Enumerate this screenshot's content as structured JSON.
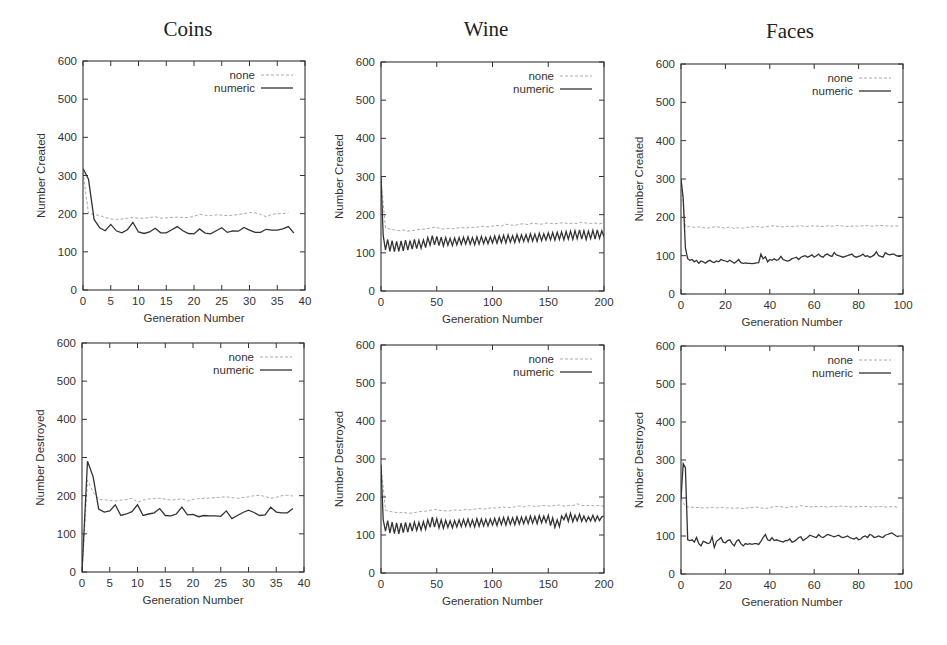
{
  "figure": {
    "columns": [
      "Coins",
      "Wine",
      "Faces"
    ],
    "legend": {
      "none": "none",
      "numeric": "numeric"
    },
    "colors": {
      "none": "#aaaaaa",
      "numeric": "#333333",
      "axis": "#333333"
    }
  },
  "chart_data": [
    {
      "id": "coins-created",
      "type": "line",
      "title": "Coins",
      "xlabel": "Generation Number",
      "ylabel": "Number Created",
      "xlim": [
        0,
        40
      ],
      "ylim": [
        0,
        600
      ],
      "xticks": [
        0,
        5,
        10,
        15,
        20,
        25,
        30,
        35,
        40
      ],
      "yticks": [
        0,
        100,
        200,
        300,
        400,
        500,
        600
      ],
      "legend_position": "top-right",
      "series": [
        {
          "name": "none",
          "style": "dashed",
          "x_start": 0,
          "x_step": 1,
          "values": [
            310,
            200,
            198,
            195,
            190,
            186,
            185,
            186,
            188,
            190,
            188,
            188,
            190,
            192,
            188,
            189,
            190,
            191,
            190,
            190,
            193,
            198,
            196,
            195,
            197,
            196,
            195,
            196,
            198,
            200,
            203,
            202,
            198,
            192,
            198,
            200,
            200,
            203
          ]
        },
        {
          "name": "numeric",
          "style": "solid",
          "x_start": 0,
          "x_step": 1,
          "values": [
            318,
            290,
            185,
            163,
            155,
            172,
            155,
            150,
            158,
            177,
            152,
            148,
            152,
            162,
            150,
            150,
            158,
            166,
            155,
            148,
            147,
            160,
            149,
            147,
            155,
            163,
            151,
            155,
            154,
            164,
            157,
            151,
            151,
            159,
            157,
            157,
            160,
            166,
            149
          ]
        }
      ]
    },
    {
      "id": "wine-created",
      "type": "line",
      "title": "Wine",
      "xlabel": "Generation Number",
      "ylabel": "Number Created",
      "xlim": [
        0,
        200
      ],
      "ylim": [
        0,
        600
      ],
      "xticks": [
        0,
        50,
        100,
        150,
        200
      ],
      "yticks": [
        0,
        100,
        200,
        300,
        400,
        500,
        600
      ],
      "legend_position": "top-right",
      "series": [
        {
          "name": "none",
          "style": "dashed",
          "x_start": 0,
          "x_step": 4,
          "values": [
            290,
            165,
            162,
            160,
            158,
            160,
            157,
            158,
            160,
            162,
            163,
            165,
            167,
            165,
            162,
            164,
            163,
            165,
            166,
            165,
            167,
            166,
            168,
            170,
            168,
            170,
            172,
            170,
            175,
            173,
            172,
            175,
            176,
            174,
            178,
            176,
            175,
            178,
            177,
            176,
            178,
            179,
            176,
            178,
            177,
            180,
            178,
            177,
            178,
            176,
            178
          ]
        },
        {
          "name": "numeric",
          "style": "solid",
          "x_start": 0,
          "x_step": 2,
          "values": [
            300,
            145,
            108,
            135,
            104,
            132,
            103,
            130,
            104,
            131,
            105,
            133,
            107,
            132,
            110,
            135,
            111,
            133,
            112,
            134,
            114,
            140,
            120,
            145,
            121,
            143,
            119,
            141,
            118,
            140,
            120,
            138,
            119,
            139,
            121,
            140,
            122,
            141,
            123,
            142,
            122,
            140,
            121,
            142,
            123,
            143,
            124,
            141,
            124,
            142,
            126,
            144,
            125,
            145,
            127,
            146,
            126,
            147,
            128,
            145,
            127,
            148,
            129,
            147,
            130,
            148,
            130,
            150,
            131,
            149,
            130,
            151,
            132,
            150,
            133,
            152,
            134,
            153,
            133,
            154,
            135,
            155,
            134,
            156,
            136,
            157,
            135,
            158,
            137,
            160,
            136,
            158,
            135,
            157,
            137,
            159,
            136,
            160,
            138,
            158,
            142
          ]
        }
      ]
    },
    {
      "id": "faces-created",
      "type": "line",
      "title": "Faces",
      "xlabel": "Generation Number",
      "ylabel": "Number Created",
      "xlim": [
        0,
        100
      ],
      "ylim": [
        0,
        600
      ],
      "xticks": [
        0,
        20,
        40,
        60,
        80,
        100
      ],
      "yticks": [
        0,
        100,
        200,
        300,
        400,
        500,
        600
      ],
      "legend_position": "top-right",
      "series": [
        {
          "name": "none",
          "style": "dashed",
          "x_start": 0,
          "x_step": 2,
          "values": [
            300,
            175,
            176,
            174,
            175,
            173,
            172,
            174,
            176,
            173,
            172,
            175,
            171,
            173,
            172,
            174,
            175,
            176,
            174,
            175,
            177,
            178,
            176,
            175,
            177,
            176,
            177,
            178,
            176,
            177,
            178,
            177,
            176,
            178,
            177,
            179,
            178,
            177,
            176,
            178,
            177,
            178,
            179,
            177,
            178,
            179,
            178,
            177,
            178,
            177
          ]
        },
        {
          "name": "numeric",
          "style": "solid",
          "x_start": 0,
          "x_step": 1,
          "values": [
            300,
            250,
            120,
            92,
            88,
            90,
            84,
            88,
            80,
            86,
            84,
            80,
            85,
            88,
            84,
            82,
            86,
            84,
            90,
            88,
            86,
            84,
            88,
            84,
            80,
            85,
            90,
            82,
            80,
            81,
            80,
            80,
            79,
            80,
            81,
            82,
            104,
            92,
            97,
            84,
            90,
            88,
            92,
            88,
            90,
            98,
            90,
            88,
            86,
            88,
            92,
            94,
            96,
            90,
            96,
            98,
            100,
            96,
            99,
            102,
            96,
            100,
            104,
            98,
            96,
            102,
            104,
            100,
            98,
            108,
            102,
            100,
            98,
            96,
            98,
            100,
            102,
            104,
            98,
            96,
            98,
            100,
            104,
            98,
            100,
            96,
            98,
            102,
            110,
            100,
            98,
            96,
            108,
            104,
            102,
            104,
            104,
            100,
            98,
            98
          ]
        }
      ]
    },
    {
      "id": "coins-destroyed",
      "type": "line",
      "title": "",
      "xlabel": "Generation Number",
      "ylabel": "Number Destroyed",
      "xlim": [
        0,
        40
      ],
      "ylim": [
        0,
        600
      ],
      "xticks": [
        0,
        5,
        10,
        15,
        20,
        25,
        30,
        35,
        40
      ],
      "yticks": [
        0,
        100,
        200,
        300,
        400,
        500,
        600
      ],
      "legend_position": "top-right",
      "series": [
        {
          "name": "none",
          "style": "dashed",
          "x_start": 0,
          "x_step": 1,
          "values": [
            0,
            240,
            210,
            190,
            189,
            188,
            186,
            188,
            190,
            193,
            183,
            188,
            191,
            192,
            193,
            191,
            188,
            190,
            192,
            186,
            190,
            192,
            193,
            194,
            195,
            196,
            197,
            195,
            193,
            195,
            197,
            200,
            201,
            198,
            193,
            196,
            200,
            201,
            199
          ]
        },
        {
          "name": "numeric",
          "style": "solid",
          "x_start": 0,
          "x_step": 1,
          "values": [
            0,
            290,
            250,
            165,
            157,
            160,
            176,
            148,
            152,
            158,
            176,
            148,
            152,
            155,
            166,
            148,
            147,
            152,
            170,
            150,
            151,
            145,
            148,
            147,
            147,
            146,
            160,
            140,
            148,
            156,
            162,
            156,
            148,
            150,
            170,
            157,
            155,
            155,
            166
          ]
        }
      ]
    },
    {
      "id": "wine-destroyed",
      "type": "line",
      "title": "",
      "xlabel": "Generation Number",
      "ylabel": "Number Destroyed",
      "xlim": [
        0,
        200
      ],
      "ylim": [
        0,
        600
      ],
      "xticks": [
        0,
        50,
        100,
        150,
        200
      ],
      "yticks": [
        0,
        100,
        200,
        300,
        400,
        500,
        600
      ],
      "legend_position": "top-right",
      "series": [
        {
          "name": "none",
          "style": "dashed",
          "x_start": 0,
          "x_step": 4,
          "values": [
            285,
            165,
            162,
            160,
            158,
            160,
            157,
            158,
            160,
            162,
            163,
            165,
            167,
            165,
            164,
            163,
            165,
            166,
            165,
            167,
            166,
            168,
            170,
            168,
            170,
            172,
            170,
            174,
            173,
            172,
            174,
            176,
            174,
            177,
            176,
            175,
            178,
            177,
            176,
            178,
            179,
            176,
            178,
            177,
            182,
            178,
            177,
            178,
            176,
            178,
            175
          ]
        },
        {
          "name": "numeric",
          "style": "solid",
          "x_start": 0,
          "x_step": 2,
          "values": [
            285,
            140,
            110,
            138,
            105,
            134,
            104,
            132,
            103,
            131,
            106,
            133,
            108,
            132,
            110,
            134,
            112,
            133,
            113,
            135,
            115,
            140,
            120,
            147,
            121,
            143,
            119,
            140,
            118,
            139,
            120,
            137,
            119,
            138,
            121,
            140,
            122,
            141,
            123,
            142,
            122,
            140,
            121,
            143,
            123,
            142,
            124,
            141,
            124,
            142,
            126,
            144,
            125,
            145,
            127,
            146,
            126,
            147,
            128,
            145,
            127,
            148,
            129,
            147,
            130,
            148,
            130,
            150,
            131,
            149,
            130,
            151,
            132,
            150,
            133,
            152,
            125,
            145,
            120,
            140,
            122,
            150,
            140,
            155,
            136,
            157,
            135,
            152,
            137,
            155,
            136,
            150,
            135,
            148,
            137,
            152,
            136,
            150,
            138,
            148,
            150
          ]
        }
      ]
    },
    {
      "id": "faces-destroyed",
      "type": "line",
      "title": "",
      "xlabel": "Generation Number",
      "ylabel": "Number Destroyed",
      "xlim": [
        0,
        100
      ],
      "ylim": [
        0,
        600
      ],
      "xticks": [
        0,
        20,
        40,
        60,
        80,
        100
      ],
      "yticks": [
        0,
        100,
        200,
        300,
        400,
        500,
        600
      ],
      "legend_position": "top-right",
      "series": [
        {
          "name": "none",
          "style": "dashed",
          "x_start": 0,
          "x_step": 2,
          "values": [
            200,
            178,
            176,
            175,
            175,
            174,
            174,
            175,
            174,
            175,
            174,
            174,
            173,
            174,
            172,
            174,
            175,
            176,
            174,
            172,
            175,
            177,
            178,
            176,
            175,
            177,
            176,
            180,
            178,
            176,
            178,
            177,
            178,
            176,
            178,
            177,
            179,
            178,
            177,
            176,
            178,
            177,
            178,
            176,
            177,
            178,
            176,
            177,
            178,
            174
          ]
        },
        {
          "name": "numeric",
          "style": "solid",
          "x_start": 0,
          "x_step": 1,
          "values": [
            200,
            290,
            280,
            90,
            88,
            90,
            84,
            96,
            80,
            74,
            86,
            84,
            80,
            82,
            98,
            70,
            86,
            90,
            96,
            84,
            82,
            88,
            90,
            80,
            74,
            86,
            90,
            80,
            74,
            80,
            78,
            80,
            78,
            80,
            80,
            78,
            86,
            96,
            104,
            90,
            88,
            96,
            88,
            90,
            88,
            86,
            84,
            88,
            88,
            92,
            84,
            86,
            90,
            96,
            98,
            88,
            92,
            96,
            102,
            100,
            98,
            96,
            104,
            98,
            96,
            100,
            104,
            102,
            100,
            98,
            100,
            102,
            98,
            96,
            98,
            100,
            96,
            94,
            92,
            96,
            90,
            92,
            98,
            100,
            96,
            104,
            102,
            96,
            98,
            100,
            98,
            96,
            102,
            104,
            106,
            108,
            104,
            100,
            98
          ]
        }
      ]
    }
  ],
  "layout_px": [
    {
      "left": 83,
      "right": 305,
      "top": 61,
      "bottom": 290
    },
    {
      "left": 381,
      "right": 604,
      "top": 62,
      "bottom": 291
    },
    {
      "left": 681,
      "right": 903,
      "top": 64,
      "bottom": 294
    },
    {
      "left": 82,
      "right": 304,
      "top": 343,
      "bottom": 572
    },
    {
      "left": 381,
      "right": 604,
      "top": 345,
      "bottom": 573
    },
    {
      "left": 681,
      "right": 903,
      "top": 346,
      "bottom": 574
    }
  ]
}
